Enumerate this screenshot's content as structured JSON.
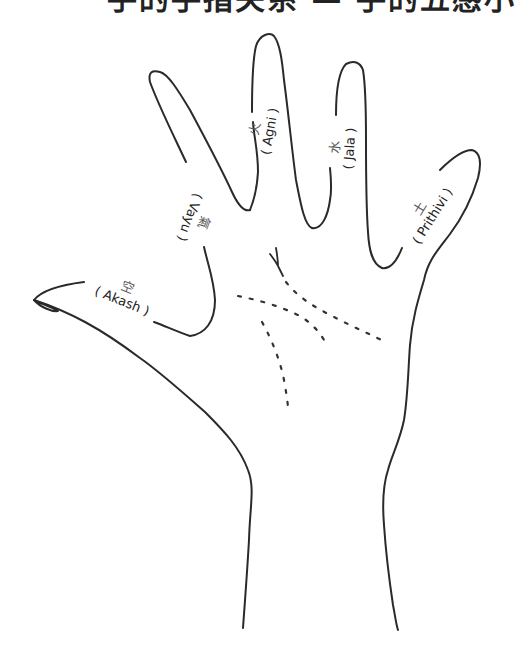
{
  "heading": {
    "text": "手的手指关系 — 手的五感小"
  },
  "diagram": {
    "fingers": [
      {
        "id": "thumb",
        "element_cn": "空",
        "element_en": "( Akash )"
      },
      {
        "id": "index",
        "element_cn": "氣",
        "element_en": "( Vayu )"
      },
      {
        "id": "middle",
        "element_cn": "火",
        "element_en": "( Agni )"
      },
      {
        "id": "ring",
        "element_cn": "水",
        "element_en": "( Jala )"
      },
      {
        "id": "little",
        "element_cn": "土",
        "element_en": "( Prithivi )"
      }
    ],
    "colors": {
      "stroke": "#2a2a2a",
      "background": "#ffffff",
      "text": "#222222"
    }
  }
}
